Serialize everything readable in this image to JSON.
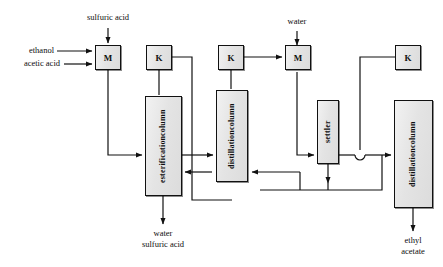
{
  "diagram": {
    "type": "process-flow-diagram",
    "canvas": {
      "width": 443,
      "height": 267
    },
    "style": {
      "line_color": "#111111",
      "unit_fill": "#e8e8e8",
      "unit_border": "#111111",
      "text_color": "#0d0d0d"
    },
    "streams": [
      {
        "name": "sulfuric-acid-feed",
        "label": "sulfuric acid",
        "to": "mixer-1"
      },
      {
        "name": "ethanol-feed",
        "label": "ethanol",
        "to": "mixer-1"
      },
      {
        "name": "acetic-acid-feed",
        "label": "acetic acid",
        "to": "mixer-1"
      },
      {
        "name": "water-feed",
        "label": "water",
        "to": "mixer-2"
      },
      {
        "name": "esterification-bottoms",
        "label": "water\nsulfuric acid",
        "from": "esterification-column"
      },
      {
        "name": "product",
        "label": "ethyl acetate",
        "from": "distillation-column-2"
      }
    ],
    "units": [
      {
        "name": "mixer-1",
        "label": "M",
        "kind": "mixer",
        "x": 95,
        "y": 45,
        "w": 26,
        "h": 25
      },
      {
        "name": "kettle-1",
        "label": "K",
        "kind": "kettle",
        "x": 146,
        "y": 45,
        "w": 26,
        "h": 25
      },
      {
        "name": "kettle-2",
        "label": "K",
        "kind": "kettle",
        "x": 218,
        "y": 45,
        "w": 26,
        "h": 25
      },
      {
        "name": "mixer-2",
        "label": "M",
        "kind": "mixer",
        "x": 285,
        "y": 47,
        "w": 26,
        "h": 25
      },
      {
        "name": "kettle-3",
        "label": "K",
        "kind": "kettle",
        "x": 395,
        "y": 45,
        "w": 26,
        "h": 25
      },
      {
        "name": "esterification-column",
        "label_line1": "esterification",
        "label_line2": "column",
        "kind": "column",
        "x": 145,
        "y": 96,
        "w": 37,
        "h": 100
      },
      {
        "name": "distillation-column-1",
        "label_line1": "distillation",
        "label_line2": "column",
        "kind": "column",
        "x": 216,
        "y": 90,
        "w": 32,
        "h": 92
      },
      {
        "name": "settler",
        "label_line1": "settler",
        "label_line2": "",
        "kind": "column",
        "x": 317,
        "y": 100,
        "w": 22,
        "h": 64
      },
      {
        "name": "distillation-column-2",
        "label_line1": "distillation",
        "label_line2": "column",
        "kind": "column",
        "x": 394,
        "y": 100,
        "w": 39,
        "h": 108
      }
    ],
    "labels": {
      "sulfuric_acid": "sulfuric acid",
      "ethanol": "ethanol",
      "acetic_acid": "acetic acid",
      "water_in": "water",
      "bottoms_line1": "water",
      "bottoms_line2": "sulfuric acid",
      "product_line1": "ethyl",
      "product_line2": "acetate",
      "mixer_1": "M",
      "mixer_2": "M",
      "kettle_1": "K",
      "kettle_2": "K",
      "kettle_3": "K",
      "esterification_l1": "esterification",
      "esterification_l2": "column",
      "distillation1_l1": "distillation",
      "distillation1_l2": "column",
      "settler_l1": "settler",
      "distillation2_l1": "distillation",
      "distillation2_l2": "column"
    }
  }
}
